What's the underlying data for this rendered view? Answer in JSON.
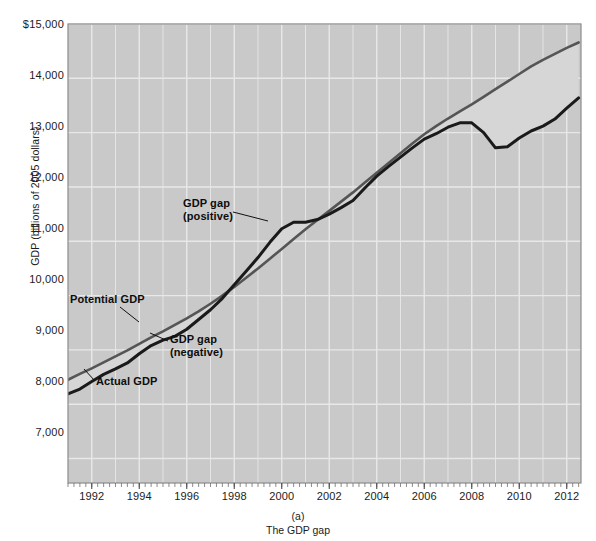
{
  "figure": {
    "top_partial_text": "",
    "caption_label": "(a)",
    "caption_title": "The GDP gap"
  },
  "axes": {
    "ylabel": "GDP (billions of 2005 dollars)",
    "y_ticks": [
      "$15,000",
      "14,000",
      "13,000",
      "12,000",
      "11,000",
      "10,000",
      "9,000",
      "8,000",
      "7,000"
    ],
    "y_tick_values": [
      15000,
      14000,
      13000,
      12000,
      11000,
      10000,
      9000,
      8000,
      7000
    ],
    "x_ticks": [
      "1992",
      "1994",
      "1996",
      "1998",
      "2000",
      "2002",
      "2004",
      "2006",
      "2008",
      "2010",
      "2012"
    ],
    "x_tick_values": [
      1992,
      1994,
      1996,
      1998,
      2000,
      2002,
      2004,
      2006,
      2008,
      2010,
      2012
    ]
  },
  "annotations": {
    "gap_positive": "GDP gap\n(positive)",
    "potential": "Potential GDP",
    "gap_negative": "GDP gap\n(negative)",
    "actual": "Actual GDP"
  },
  "colors": {
    "plot_background": "#c9c9c9",
    "gridline": "#e8e8e8",
    "actual_line": "#1a1a1a",
    "potential_line": "#555555",
    "gap_fill": "#d6d6d6",
    "axis": "#8c8c8c",
    "text": "#1b1b1b"
  },
  "chart_data": {
    "type": "line",
    "title": "The GDP gap",
    "xlabel": "",
    "ylabel": "GDP (billions of 2005 dollars)",
    "xlim": [
      1991.0,
      2012.6
    ],
    "ylim": [
      6550,
      15000
    ],
    "grid": true,
    "legend": "inline-annotations",
    "x": [
      1991.0,
      1991.5,
      1992.0,
      1992.5,
      1993.0,
      1993.5,
      1994.0,
      1994.5,
      1995.0,
      1995.5,
      1996.0,
      1996.5,
      1997.0,
      1997.5,
      1998.0,
      1998.5,
      1999.0,
      1999.5,
      2000.0,
      2000.5,
      2001.0,
      2001.5,
      2002.0,
      2002.5,
      2003.0,
      2003.5,
      2004.0,
      2004.5,
      2005.0,
      2005.5,
      2006.0,
      2006.5,
      2007.0,
      2007.5,
      2008.0,
      2008.5,
      2009.0,
      2009.5,
      2010.0,
      2010.5,
      2011.0,
      2011.5,
      2012.0,
      2012.5
    ],
    "series": [
      {
        "name": "Actual GDP",
        "values": [
          8190,
          8280,
          8420,
          8550,
          8650,
          8760,
          8930,
          9080,
          9180,
          9250,
          9380,
          9560,
          9740,
          9950,
          10200,
          10450,
          10700,
          10980,
          11230,
          11350,
          11350,
          11400,
          11500,
          11620,
          11750,
          11980,
          12200,
          12380,
          12550,
          12720,
          12880,
          12980,
          13100,
          13180,
          13180,
          13000,
          12720,
          12740,
          12900,
          13030,
          13120,
          13250,
          13450,
          13640
        ]
      },
      {
        "name": "Potential GDP",
        "values": [
          8450,
          8560,
          8660,
          8770,
          8880,
          8990,
          9110,
          9230,
          9340,
          9460,
          9580,
          9710,
          9850,
          10000,
          10160,
          10330,
          10500,
          10680,
          10860,
          11040,
          11220,
          11390,
          11560,
          11730,
          11900,
          12080,
          12260,
          12440,
          12620,
          12800,
          12970,
          13120,
          13260,
          13390,
          13520,
          13660,
          13800,
          13940,
          14080,
          14220,
          14340,
          14450,
          14560,
          14660
        ]
      }
    ]
  }
}
